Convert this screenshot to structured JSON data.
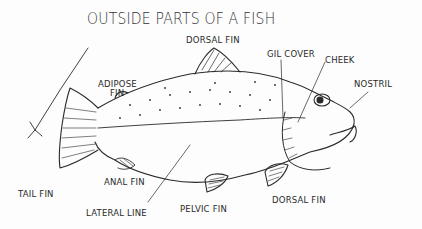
{
  "title": "OUTSIDE  PARTS OF A FISH",
  "labels": {
    "dorsal_fin_top": "DORSAL FIN",
    "gil_cover": "GIL COVER",
    "cheek": "CHEEK",
    "nostril": "NOSTRIL",
    "adipose_fin_line1": "ADIPOSE",
    "adipose_fin_line2": "FIN",
    "tail_fin": "TAIL FIN",
    "anal_fin": "ANAL FIN",
    "lateral_line": "LATERAL LINE",
    "pelvic_fin": "PELVIC FIN",
    "dorsal_fin_bottom": "DORSAL FIN"
  },
  "colors": {
    "ink": "#2a2a2a",
    "background": "#fdfdfd"
  }
}
